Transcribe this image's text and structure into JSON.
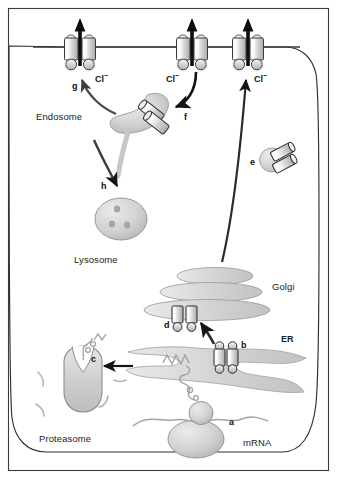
{
  "figure": {
    "background_color": "#ffffff",
    "frame_color": "#3a3a3a",
    "membrane_color": "#4a4a4a",
    "organelle_fill": "#cfcfcf",
    "organelle_stroke": "#8a8a8a",
    "arrow_color": "#1a1a1a"
  },
  "labels": {
    "organelles": [
      {
        "id": "endosome",
        "text": "Endosome",
        "x": 36,
        "y": 117
      },
      {
        "id": "lysosome",
        "text": "Lysosome",
        "x": 74,
        "y": 261
      },
      {
        "id": "golgi",
        "text": "Golgi",
        "x": 272,
        "y": 288
      },
      {
        "id": "er",
        "text": "ER",
        "x": 280,
        "y": 341
      },
      {
        "id": "proteasome",
        "text": "Proteasome",
        "x": 39,
        "y": 440
      },
      {
        "id": "mrna",
        "text": "mRNA",
        "x": 243,
        "y": 444
      }
    ],
    "steps": [
      {
        "id": "a",
        "text": "a",
        "x": 229,
        "y": 424
      },
      {
        "id": "b",
        "text": "b",
        "x": 236,
        "y": 347
      },
      {
        "id": "c",
        "text": "c",
        "x": 91,
        "y": 361
      },
      {
        "id": "d",
        "text": "d",
        "x": 166,
        "y": 327
      },
      {
        "id": "e",
        "text": "e",
        "x": 250,
        "y": 164
      },
      {
        "id": "f",
        "text": "f",
        "x": 184,
        "y": 119
      },
      {
        "id": "g",
        "text": "g",
        "x": 72,
        "y": 88
      },
      {
        "id": "h",
        "text": "h",
        "x": 101,
        "y": 188
      }
    ],
    "ions": [
      {
        "id": "cl-left",
        "text": "Cl",
        "charge": "−",
        "x": 95,
        "y": 78
      },
      {
        "id": "cl-middle",
        "text": "Cl",
        "charge": "−",
        "x": 171,
        "y": 78
      },
      {
        "id": "cl-right",
        "text": "Cl",
        "charge": "−",
        "x": 252,
        "y": 78
      }
    ]
  },
  "structures": {
    "plasma_membrane_channels": [
      {
        "id": "channel-left",
        "x": 80,
        "label": "g"
      },
      {
        "id": "channel-middle",
        "x": 192,
        "label": null
      },
      {
        "id": "channel-right",
        "x": 248,
        "label": null
      }
    ],
    "golgi_cisternae": 3,
    "lysosome_granules": 3,
    "endosome_channels": 2,
    "vesicle_e_channels": 2,
    "golgi_channel_pairs": 1,
    "er_channel_pairs": 1
  }
}
